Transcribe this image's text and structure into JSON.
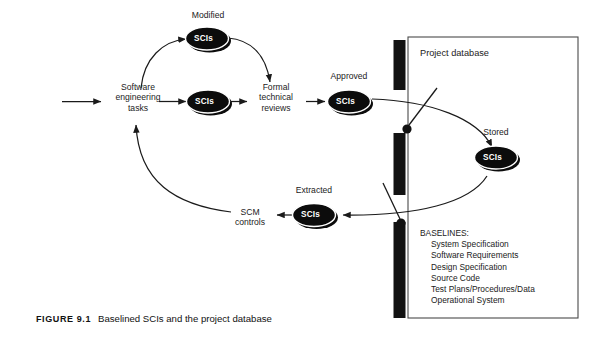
{
  "figure": {
    "caption_number": "FIGURE 9.1",
    "caption_text": "Baselined SCIs and the project database"
  },
  "flow": {
    "start_node_label": "Software\nengineering\ntasks",
    "review_node_label": "Formal\ntechnical\nreviews",
    "controls_node_label": "SCM\ncontrols",
    "sci_label": "SCIs"
  },
  "states": {
    "modified": "Modified",
    "approved": "Approved",
    "stored": "Stored",
    "extracted": "Extracted"
  },
  "database": {
    "title": "Project database",
    "baselines_heading": "BASELINES:",
    "baselines": [
      "System Specification",
      "Software Requirements",
      "Design Specification",
      "Source Code",
      "Test Plans/Procedures/Data",
      "Operational System"
    ]
  },
  "colors": {
    "ink": "#1a1a1a",
    "node_fill": "#0c0c0c",
    "node_text": "#ffffff",
    "page": "#ffffff",
    "box_border": "#4a4a4a",
    "bar": "#121212"
  }
}
